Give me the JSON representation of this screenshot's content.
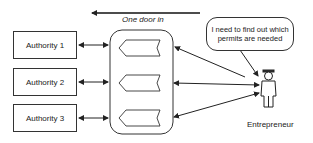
{
  "diagram": {
    "top_label": "One door in",
    "authorities": [
      {
        "label": "Authority 1"
      },
      {
        "label": "Authority 2"
      },
      {
        "label": "Authority 3"
      }
    ],
    "hub": {
      "slots": 3
    },
    "actor": {
      "label": "Entrepreneur"
    },
    "speech_bubble": {
      "text": "I need to find out which permits are needed"
    }
  }
}
